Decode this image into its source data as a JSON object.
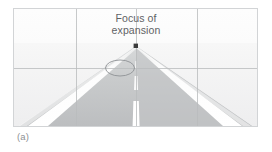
{
  "figure": {
    "subfigure_label": "(a)",
    "annotation": {
      "line1": "Focus of",
      "line2": "expansion",
      "marker_icon": "black-square-marker",
      "marker_x": 122,
      "marker_y": 36
    },
    "colors": {
      "panel_background": "#fbfbfb",
      "panel_border": "#d2d4d6",
      "grid_line": "#b9bbbd",
      "road_surface": "#c8cacb",
      "road_surface_dark": "#bdbfc1",
      "road_stripe": "#ffffff",
      "marker": "#3a3a3a",
      "annotation_text": "#5f6265",
      "caption_text": "#8e9194",
      "ellipse_stroke": "#8f9295"
    },
    "grid": {
      "vertical_lines_x": [
        62,
        122,
        183
      ],
      "horizontal_lines_y": [
        59
      ],
      "columns": 3,
      "rows": 2,
      "grid_visible": true
    },
    "ellipse": {
      "center_x": 106,
      "center_y": 59,
      "radius_x": 14,
      "radius_y": 8,
      "label": "gaze-region-ellipse"
    },
    "road": {
      "vanishing_point_x": 122,
      "vanishing_point_y": 37,
      "left_edge_bottom_x": 6,
      "right_edge_bottom_x": 238,
      "bottom_y": 117,
      "center_line_dashes": 3
    }
  }
}
